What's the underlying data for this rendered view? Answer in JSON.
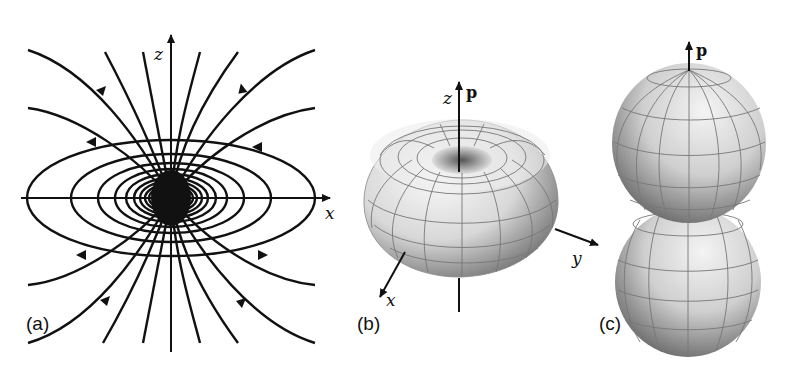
{
  "figure": {
    "panels": [
      {
        "id": "a",
        "label": "(a)",
        "description": "Electric dipole field lines in the x-z plane",
        "axes": {
          "horizontal": "x",
          "vertical": "z"
        }
      },
      {
        "id": "b",
        "label": "(b)",
        "description": "Toroidal radiation pattern of dipole",
        "axes": {
          "vertical": "z",
          "x": "x",
          "y": "y"
        },
        "vector": "p"
      },
      {
        "id": "c",
        "label": "(c)",
        "description": "Two-lobe dipole pattern along p",
        "vector": "p"
      }
    ]
  }
}
